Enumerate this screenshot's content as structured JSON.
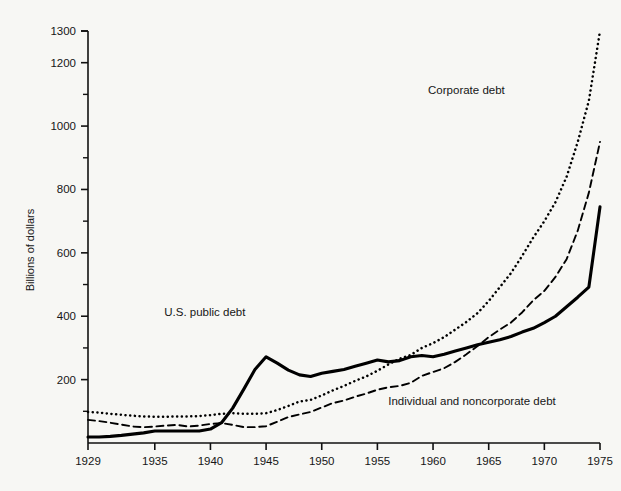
{
  "chart_data": {
    "type": "line",
    "title": "",
    "xlabel": "",
    "ylabel": "Billions of dollars",
    "xlim": [
      1929,
      1975
    ],
    "ylim": [
      0,
      1300
    ],
    "grid": false,
    "legend_position": "inline-annotations",
    "x_ticks": [
      "1929",
      "1935",
      "1940",
      "1945",
      "1950",
      "1955",
      "1960",
      "1965",
      "1970",
      "1975"
    ],
    "x_tick_values": [
      1929,
      1935,
      1940,
      1945,
      1950,
      1955,
      1960,
      1965,
      1970,
      1975
    ],
    "y_ticks": [
      "200",
      "400",
      "600",
      "800",
      "1000",
      "1200",
      "1300"
    ],
    "y_tick_values": [
      200,
      400,
      600,
      800,
      1000,
      1200,
      1300
    ],
    "y_minor_ticks": [
      100,
      300,
      500,
      700,
      900,
      1100
    ],
    "x": [
      1929,
      1930,
      1931,
      1932,
      1933,
      1934,
      1935,
      1936,
      1937,
      1938,
      1939,
      1940,
      1941,
      1942,
      1943,
      1944,
      1945,
      1946,
      1947,
      1948,
      1949,
      1950,
      1951,
      1952,
      1953,
      1954,
      1955,
      1956,
      1957,
      1958,
      1959,
      1960,
      1961,
      1962,
      1963,
      1964,
      1965,
      1966,
      1967,
      1968,
      1969,
      1970,
      1971,
      1972,
      1973,
      1974,
      1975
    ],
    "series": [
      {
        "name": "Corporate debt",
        "style": "dotted",
        "color": "#000000",
        "label": "Corporate debt",
        "label_x": 1963.0,
        "label_y": 1100,
        "values": [
          98,
          96,
          92,
          89,
          86,
          84,
          83,
          83,
          84,
          84,
          85,
          88,
          92,
          94,
          92,
          92,
          94,
          104,
          117,
          131,
          136,
          150,
          166,
          180,
          196,
          210,
          228,
          248,
          266,
          278,
          300,
          315,
          334,
          358,
          382,
          410,
          448,
          492,
          536,
          590,
          648,
          700,
          760,
          840,
          950,
          1080,
          1300
        ]
      },
      {
        "name": "Individual and noncorporate debt",
        "style": "dashed",
        "color": "#000000",
        "label": "Individual and noncorporate debt",
        "label_x": 1963.5,
        "label_y": 120,
        "values": [
          73,
          69,
          64,
          58,
          52,
          50,
          52,
          55,
          57,
          52,
          55,
          60,
          63,
          57,
          50,
          50,
          53,
          67,
          82,
          90,
          98,
          112,
          126,
          134,
          146,
          156,
          168,
          176,
          180,
          190,
          212,
          224,
          236,
          256,
          280,
          306,
          334,
          358,
          380,
          412,
          450,
          480,
          524,
          580,
          670,
          790,
          950
        ]
      },
      {
        "name": "U.S. public debt",
        "style": "solid",
        "color": "#000000",
        "label": "U.S. public debt",
        "label_x": 1939.5,
        "label_y": 400,
        "values": [
          19,
          19,
          21,
          24,
          28,
          32,
          38,
          38,
          38,
          38,
          38,
          44,
          64,
          110,
          170,
          232,
          272,
          252,
          230,
          215,
          210,
          220,
          226,
          232,
          242,
          252,
          262,
          256,
          260,
          272,
          276,
          272,
          280,
          290,
          300,
          310,
          318,
          326,
          336,
          350,
          362,
          380,
          400,
          430,
          460,
          492,
          745
        ]
      }
    ]
  },
  "axis": {
    "y_title": "Billions of dollars"
  }
}
